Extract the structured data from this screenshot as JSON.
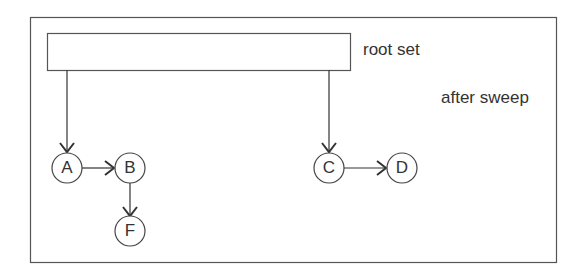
{
  "labels": {
    "root_set": "root set",
    "phase": "after sweep"
  },
  "nodes": [
    {
      "id": "A",
      "label": "A"
    },
    {
      "id": "B",
      "label": "B"
    },
    {
      "id": "F",
      "label": "F"
    },
    {
      "id": "C",
      "label": "C"
    },
    {
      "id": "D",
      "label": "D"
    }
  ],
  "edges": [
    {
      "from": "root",
      "to": "A"
    },
    {
      "from": "root",
      "to": "C"
    },
    {
      "from": "A",
      "to": "B"
    },
    {
      "from": "B",
      "to": "F"
    },
    {
      "from": "C",
      "to": "D"
    }
  ]
}
